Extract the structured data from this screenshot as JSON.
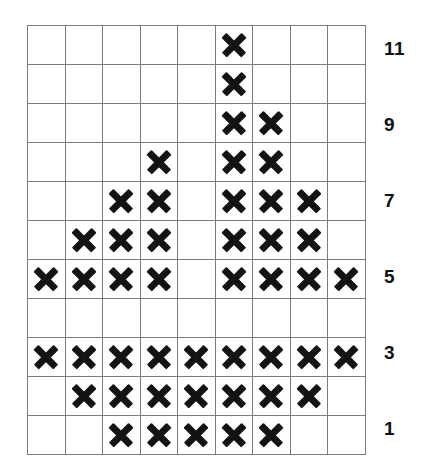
{
  "chart_data": {
    "type": "scatter",
    "title": "",
    "xlabel": "",
    "ylabel": "",
    "grid": true,
    "legend": null,
    "columns": 9,
    "rows": 11,
    "row_labels_visible": [
      "11",
      "",
      "9",
      "",
      "7",
      "",
      "5",
      "",
      "3",
      "",
      "1"
    ],
    "axis_tick_labels": [
      "11",
      "9",
      "7",
      "5",
      "3",
      "1"
    ],
    "axis_tick_rows": [
      1,
      3,
      5,
      7,
      9,
      11
    ],
    "ylim": [
      1,
      11
    ],
    "marked_cells_by_row": [
      [
        6
      ],
      [
        6
      ],
      [
        6,
        7
      ],
      [
        4,
        6,
        7
      ],
      [
        3,
        4,
        6,
        7,
        8
      ],
      [
        2,
        3,
        4,
        6,
        7,
        8
      ],
      [
        1,
        2,
        3,
        4,
        6,
        7,
        8,
        9
      ],
      [],
      [
        1,
        2,
        3,
        4,
        5,
        6,
        7,
        8,
        9
      ],
      [
        2,
        3,
        4,
        5,
        6,
        7,
        8
      ],
      [
        3,
        4,
        5,
        6,
        7
      ]
    ],
    "categories": [
      "1",
      "2",
      "3",
      "4",
      "5",
      "6",
      "7",
      "8",
      "9"
    ],
    "values": [
      3,
      4,
      5,
      6,
      3,
      10,
      8,
      5,
      2
    ],
    "series": [
      {
        "name": "X count per column",
        "values": [
          3,
          4,
          5,
          6,
          3,
          10,
          8,
          5,
          2
        ]
      }
    ]
  },
  "grid": {
    "row_count": 11,
    "column_count": 9,
    "cell_mark_glyph": "x-mark",
    "border_color": "#7c7c7c",
    "mark_color": "#131313"
  },
  "axis": {
    "labels": [
      {
        "text": "11",
        "row": 1
      },
      {
        "text": "9",
        "row": 3
      },
      {
        "text": "7",
        "row": 5
      },
      {
        "text": "5",
        "row": 7
      },
      {
        "text": "3",
        "row": 9
      },
      {
        "text": "1",
        "row": 11
      }
    ]
  }
}
